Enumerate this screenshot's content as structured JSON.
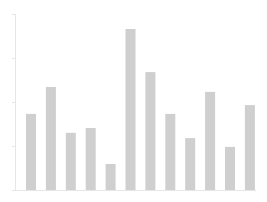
{
  "chart_data": {
    "type": "bar",
    "title": "",
    "xlabel": "",
    "ylabel": "",
    "categories": [
      "1",
      "2",
      "3",
      "4",
      "5",
      "6",
      "7",
      "8",
      "9",
      "10",
      "11",
      "12"
    ],
    "values": [
      1.73,
      2.34,
      1.3,
      1.41,
      0.59,
      3.66,
      2.68,
      1.73,
      1.18,
      2.23,
      0.98,
      1.93
    ],
    "ylim": [
      0,
      4
    ],
    "yticks": [
      0,
      1,
      2,
      3,
      4
    ],
    "tick_labels_visible": false,
    "grid": false,
    "legend": null,
    "colors": {
      "bar": "#cfcfcf",
      "axis": "#e6e6e6",
      "background": "#ffffff"
    }
  },
  "layout": {
    "plot_left": 15,
    "plot_right": 256,
    "plot_top": 14,
    "baseline": 190,
    "first_bar_x": 26,
    "bar_step": 19.9,
    "bar_width": 10
  }
}
